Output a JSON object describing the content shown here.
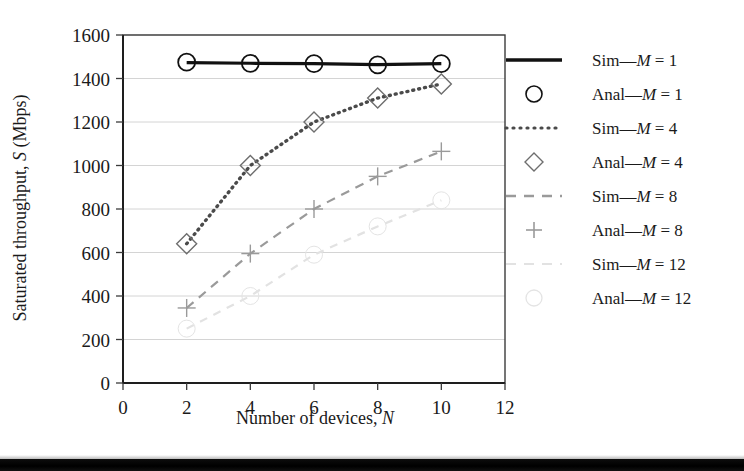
{
  "figure": {
    "background_color": "#ffffff",
    "bottom_rule_color": "#000000"
  },
  "axes": {
    "x_title_prefix": "Number of devices, ",
    "x_title_symbol": "N",
    "y_title_prefix": "Saturated throughput, ",
    "y_title_symbol": "S",
    "y_title_suffix": " (Mbps)",
    "x_ticks": [
      "0",
      "2",
      "4",
      "6",
      "8",
      "10",
      "12"
    ],
    "y_ticks": [
      "0",
      "200",
      "400",
      "600",
      "800",
      "1000",
      "1200",
      "1400",
      "1600"
    ]
  },
  "legend": {
    "position": "right",
    "items": [
      {
        "key": "sim-m1",
        "marker": "solid-line",
        "prefix": "Sim—",
        "symbol": "M",
        "value": " = 1",
        "color": "#111111"
      },
      {
        "key": "anal-m1",
        "marker": "circle",
        "prefix": "Anal—",
        "symbol": "M",
        "value": " = 1",
        "color": "#111111"
      },
      {
        "key": "sim-m4",
        "marker": "dotted-line",
        "prefix": "Sim—",
        "symbol": "M",
        "value": " = 4",
        "color": "#4a4a4a"
      },
      {
        "key": "anal-m4",
        "marker": "diamond",
        "prefix": "Anal—",
        "symbol": "M",
        "value": " = 4",
        "color": "#6e6e6e"
      },
      {
        "key": "sim-m8",
        "marker": "dashed-line",
        "prefix": "Sim—",
        "symbol": "M",
        "value": " = 8",
        "color": "#9a9a9a"
      },
      {
        "key": "anal-m8",
        "marker": "plus",
        "prefix": "Anal—",
        "symbol": "M",
        "value": " = 8",
        "color": "#9a9a9a"
      },
      {
        "key": "sim-m12",
        "marker": "faint-dashed-line",
        "prefix": "Sim—",
        "symbol": "M",
        "value": " = 12",
        "color": "#e2e2e2"
      },
      {
        "key": "anal-m12",
        "marker": "faint-circle",
        "prefix": "Anal—",
        "symbol": "M",
        "value": " = 12",
        "color": "#e4e4e4"
      }
    ]
  },
  "chart_data": {
    "type": "line",
    "title": "",
    "xlabel": "Number of devices, N",
    "ylabel": "Saturated throughput, S (Mbps)",
    "xlim": [
      0,
      12
    ],
    "ylim": [
      0,
      1600
    ],
    "xticks": [
      0,
      2,
      4,
      6,
      8,
      10,
      12
    ],
    "yticks": [
      0,
      200,
      400,
      600,
      800,
      1000,
      1200,
      1400,
      1600
    ],
    "grid": "horizontal",
    "legend_position": "right-outside",
    "x": [
      2,
      4,
      6,
      8,
      10
    ],
    "series": [
      {
        "name": "Sim—M = 1",
        "style": "solid",
        "marker": "none",
        "color": "#111111",
        "values": [
          1473,
          1470,
          1468,
          1464,
          1468
        ]
      },
      {
        "name": "Anal—M = 1",
        "style": "none",
        "marker": "circle",
        "color": "#111111",
        "values": [
          1475,
          1470,
          1468,
          1463,
          1468
        ]
      },
      {
        "name": "Sim—M = 4",
        "style": "dotted",
        "marker": "none",
        "color": "#4a4a4a",
        "values": [
          640,
          1000,
          1200,
          1310,
          1375
        ]
      },
      {
        "name": "Anal—M = 4",
        "style": "none",
        "marker": "diamond",
        "color": "#6e6e6e",
        "values": [
          640,
          1000,
          1200,
          1310,
          1375
        ]
      },
      {
        "name": "Sim—M = 8",
        "style": "dashed",
        "marker": "none",
        "color": "#9a9a9a",
        "values": [
          345,
          595,
          800,
          950,
          1065
        ]
      },
      {
        "name": "Anal—M = 8",
        "style": "none",
        "marker": "plus",
        "color": "#9a9a9a",
        "values": [
          345,
          595,
          800,
          950,
          1065
        ]
      },
      {
        "name": "Sim—M = 12",
        "style": "dashed",
        "marker": "none",
        "color": "#e2e2e2",
        "values": [
          250,
          400,
          590,
          720,
          840
        ]
      },
      {
        "name": "Anal—M = 12",
        "style": "none",
        "marker": "circle",
        "color": "#e4e4e4",
        "values": [
          250,
          400,
          590,
          720,
          840
        ]
      }
    ]
  }
}
